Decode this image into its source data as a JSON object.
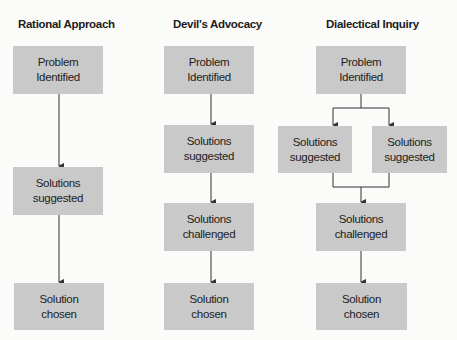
{
  "columns": [
    {
      "title": "Rational Approach",
      "boxes": [
        "Problem\nIdentified",
        "Solutions\nsuggested",
        "Solution\nchosen"
      ]
    },
    {
      "title": "Devil's Advocacy",
      "boxes": [
        "Problem\nIdentified",
        "Solutions\nsuggested",
        "Solutions\nchallenged",
        "Solution\nchosen"
      ]
    },
    {
      "title": "Dialectical Inquiry",
      "boxes": [
        "Problem\nIdentified",
        "Solutions\nsuggested",
        "Solutions\nsuggested",
        "Solutions\nchallenged",
        "Solution\nchosen"
      ]
    }
  ],
  "colors": {
    "box_fill": "#c9c9c9",
    "line": "#333333",
    "background": "#fbfbfa"
  }
}
